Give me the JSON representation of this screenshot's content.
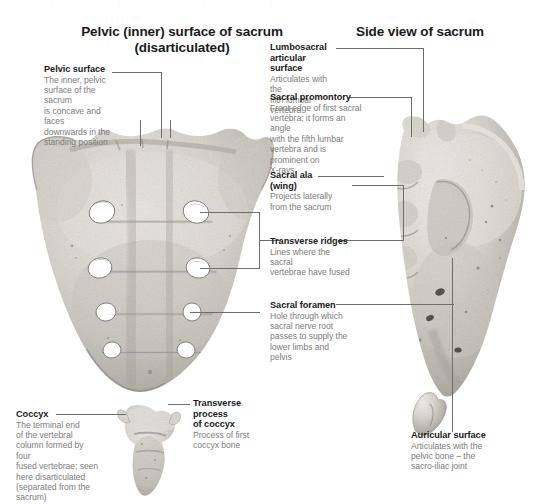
{
  "page": {
    "background_color": "#ffffff",
    "title_color": "#1a1a1a",
    "body_text_color": "#7d7d7d",
    "leader_line_color": "#6e6e6e",
    "bone_light": "#e8e6e1",
    "bone_mid": "#c3c0b9",
    "bone_dark": "#8d8a84"
  },
  "headings": {
    "left": "Pelvic (inner) surface of sacrum\n(disarticulated)",
    "left_line1": "Pelvic (inner) surface of sacrum",
    "left_line2": "(disarticulated)",
    "right": "Side view of sacrum"
  },
  "callouts": [
    {
      "id": "pelvic-surface",
      "title": "Pelvic surface",
      "description": "The inner, pelvic\nsurface of the sacrum\nis concave and faces\ndownwards in the\nstanding position"
    },
    {
      "id": "lumbosacral-articular-surface",
      "title": "Lumbosacral\narticular surface",
      "title_line1": "Lumbosacral",
      "title_line2": "articular surface",
      "description": "Articulates with the\nfifth lumbar vertebra"
    },
    {
      "id": "sacral-promontory",
      "title": "Sacral promontory",
      "description": "Front edge of first sacral\nvertebra; it forms an angle\nwith the fifth lumbar\nvertebra and is\nprominent on\nX-rays"
    },
    {
      "id": "sacral-ala-wing",
      "title": "Sacral ala\n(wing)",
      "title_line1": "Sacral ala",
      "title_line2": "(wing)",
      "description": "Projects laterally\nfrom the sacrum"
    },
    {
      "id": "transverse-ridges",
      "title": "Transverse ridges",
      "description": "Lines where the sacral\nvertebrae have fused"
    },
    {
      "id": "sacral-foramen",
      "title": "Sacral foramen",
      "description": "Hole through which\nsacral nerve root\npasses to supply the\nlower limbs and pelvis"
    },
    {
      "id": "coccyx",
      "title": "Coccyx",
      "description": "The terminal end\nof the vertebral\ncolumn formed by four\nfused vertebrae; seen\nhere disarticulated\n(separated from the\nsacrum)"
    },
    {
      "id": "transverse-process-of-coccyx",
      "title": "Transverse\nprocess\nof coccyx",
      "title_line1": "Transverse",
      "title_line2": "process",
      "title_line3": "of coccyx",
      "description": "Process of first\ncoccyx bone"
    },
    {
      "id": "auricular-surface",
      "title": "Auricular surface",
      "description": "Articulates with the\npelvic bone – the\nsacro-iliac joint"
    }
  ],
  "figures": [
    {
      "id": "sacrum-pelvic-view",
      "name": "sacrum anterior pelvic surface photograph",
      "foramina_pairs": 4
    },
    {
      "id": "sacrum-side-view",
      "name": "sacrum lateral side view photograph"
    },
    {
      "id": "coccyx-bone",
      "name": "coccyx bone photograph"
    }
  ]
}
